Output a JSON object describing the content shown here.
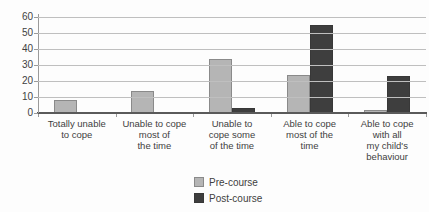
{
  "chart_data": {
    "type": "bar",
    "title": "",
    "categories": [
      [
        "Totally unable",
        "to cope"
      ],
      [
        "Unable to cope",
        "most of",
        "the time"
      ],
      [
        "Unable to",
        "cope some",
        "of the time"
      ],
      [
        "Able to cope",
        "most of the",
        "time"
      ],
      [
        "Able to cope",
        "with all",
        "my child's",
        "behaviour"
      ]
    ],
    "series": [
      {
        "name": "Pre-course",
        "fill": "#b5b5b5",
        "border": "#8a8a8a",
        "values": [
          8,
          14,
          34,
          24,
          2
        ]
      },
      {
        "name": "Post-course",
        "fill": "#3e3e3e",
        "border": "#383838",
        "values": [
          0,
          0,
          3,
          55,
          23
        ]
      }
    ],
    "ylim": [
      0,
      60
    ],
    "yticks": [
      0,
      10,
      20,
      30,
      40,
      50,
      60
    ],
    "grid": true,
    "legend_position": "bottom-center",
    "colors": {
      "gridline": "#bfbfbf",
      "axis": "#9a9a9a",
      "baseline": "#5a5a5a",
      "text": "#3f3f3f",
      "background": "#fdfdfd"
    }
  }
}
